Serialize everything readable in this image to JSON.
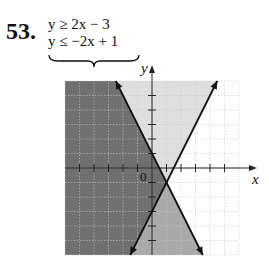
{
  "problem": {
    "number": "53.",
    "inequalities": [
      "y ≥ 2x − 3",
      "y ≤ −2x + 1"
    ]
  },
  "axes": {
    "x_label": "x",
    "y_label": "y",
    "origin_label": "0"
  },
  "colors": {
    "solution_region": "#707070",
    "only_ineq2_region": "#a9a9a9",
    "only_ineq1_region": "#dedede",
    "neither_region": "#ffffff",
    "lines": "#111111",
    "grid": "#c8c8c8"
  },
  "chart_data": {
    "type": "line",
    "xlabel": "x",
    "ylabel": "y",
    "xlim": [
      -6,
      6
    ],
    "ylim": [
      -6,
      6
    ],
    "grid": true,
    "tick_spacing": 1,
    "series": [
      {
        "name": "y = 2x − 3",
        "slope": 2,
        "intercept": -3,
        "line_style": "solid",
        "shade": "above",
        "points": [
          [
            -1.5,
            -6
          ],
          [
            4.5,
            6
          ]
        ]
      },
      {
        "name": "y = −2x + 1",
        "slope": -2,
        "intercept": 1,
        "line_style": "solid",
        "shade": "below",
        "points": [
          [
            -2.5,
            6
          ],
          [
            3.5,
            -6
          ]
        ]
      }
    ],
    "intersection": [
      1,
      -1
    ],
    "solution_region": "left wedge: above y = 2x − 3 and below y = −2x + 1 (darkest shading)"
  }
}
